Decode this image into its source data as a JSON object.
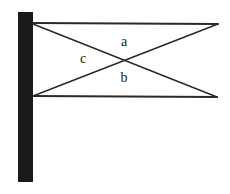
{
  "diagram": {
    "type": "structural-bracket",
    "colors": {
      "background": "#ffffff",
      "wall": "#1a1a1a",
      "line": "#2a2a2a",
      "label": "#222222"
    },
    "wall": {
      "x": 18,
      "y": 12,
      "width": 15,
      "height": 170
    },
    "members": [
      {
        "id": "top-horizontal",
        "x1": 33,
        "y1": 23,
        "x2": 218,
        "y2": 24,
        "width": 2
      },
      {
        "id": "bottom-horizontal",
        "x1": 33,
        "y1": 96,
        "x2": 217,
        "y2": 97,
        "width": 2
      },
      {
        "id": "diagonal-top-left-to-bottom-right",
        "x1": 33,
        "y1": 24,
        "x2": 217,
        "y2": 97,
        "width": 1.5
      },
      {
        "id": "diagonal-bottom-left-to-top-right",
        "x1": 33,
        "y1": 96,
        "x2": 218,
        "y2": 24,
        "width": 1.5
      }
    ],
    "labels": [
      {
        "id": "label-a",
        "text": "a",
        "x": 124,
        "y": 46
      },
      {
        "id": "label-b",
        "text": "b",
        "x": 124,
        "y": 82
      },
      {
        "id": "label-c",
        "text": "c",
        "x": 83,
        "y": 63
      }
    ]
  }
}
